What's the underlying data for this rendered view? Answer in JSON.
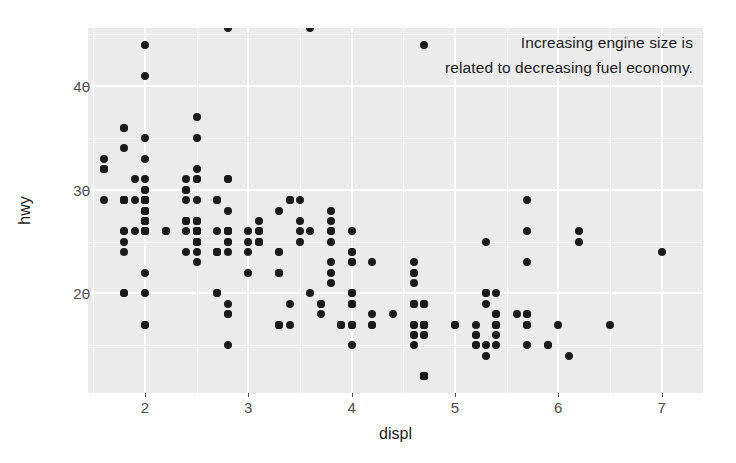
{
  "chart_data": {
    "type": "scatter",
    "title": "",
    "annotation": "Increasing engine size is\nrelated to decreasing fuel economy.",
    "xlabel": "displ",
    "ylabel": "hwy",
    "xlim": [
      1.45,
      7.4
    ],
    "ylim": [
      10.4,
      45.6
    ],
    "xticks": [
      2,
      3,
      4,
      5,
      6,
      7
    ],
    "yticks": [
      20,
      30,
      40
    ],
    "x_minor_ticks": [
      1.5,
      2.5,
      3.5,
      4.5,
      5.5,
      6.5
    ],
    "y_minor_ticks": [
      15,
      25,
      35,
      45
    ],
    "grid": true,
    "legend": "none",
    "panel_background": "#ebebeb",
    "grid_color": "#ffffff",
    "point_color": "#1a1a1a",
    "axis_text_color": "#4d4d4d",
    "n_points": 234,
    "x": [
      1.8,
      1.8,
      2.0,
      2.0,
      2.8,
      2.8,
      3.1,
      1.8,
      1.8,
      2.0,
      2.0,
      2.8,
      2.8,
      3.1,
      3.1,
      2.8,
      3.1,
      4.2,
      5.3,
      5.3,
      5.3,
      5.7,
      6.0,
      5.7,
      5.7,
      6.2,
      6.2,
      7.0,
      5.3,
      5.3,
      5.7,
      6.5,
      2.4,
      2.4,
      3.1,
      3.5,
      3.6,
      2.4,
      3.0,
      3.3,
      3.3,
      3.3,
      3.3,
      3.3,
      3.8,
      3.8,
      3.8,
      4.0,
      3.7,
      3.7,
      3.9,
      3.9,
      4.7,
      4.7,
      4.7,
      5.2,
      5.2,
      3.9,
      4.7,
      4.7,
      4.7,
      5.2,
      5.7,
      5.9,
      4.7,
      4.7,
      4.7,
      4.7,
      4.7,
      4.7,
      5.2,
      5.2,
      5.7,
      5.9,
      4.6,
      5.4,
      5.4,
      4.0,
      4.0,
      4.0,
      4.0,
      4.6,
      5.0,
      4.2,
      4.2,
      4.6,
      4.6,
      4.6,
      5.4,
      5.4,
      3.8,
      3.8,
      4.0,
      4.0,
      4.6,
      4.6,
      4.6,
      4.6,
      5.4,
      1.6,
      1.6,
      1.6,
      1.6,
      1.6,
      1.8,
      1.8,
      1.8,
      2.0,
      2.4,
      2.4,
      2.4,
      2.4,
      2.5,
      2.5,
      3.3,
      2.0,
      2.0,
      2.0,
      2.0,
      2.7,
      2.7,
      2.7,
      3.0,
      3.7,
      4.0,
      4.7,
      4.7,
      4.7,
      5.7,
      6.1,
      4.0,
      4.2,
      4.4,
      4.6,
      5.4,
      5.4,
      5.4,
      4.0,
      4.0,
      4.6,
      5.0,
      2.4,
      2.4,
      2.5,
      2.5,
      3.5,
      3.5,
      3.0,
      3.0,
      3.5,
      3.3,
      3.3,
      4.0,
      5.6,
      3.1,
      3.8,
      3.8,
      3.8,
      5.3,
      2.5,
      2.5,
      2.5,
      2.5,
      2.5,
      2.5,
      2.2,
      2.2,
      2.5,
      2.5,
      2.5,
      2.5,
      2.5,
      2.5,
      2.7,
      2.7,
      3.4,
      3.4,
      2.0,
      2.0,
      2.0,
      2.0,
      2.8,
      1.9,
      2.0,
      2.0,
      2.0,
      2.0,
      2.5,
      2.5,
      2.8,
      2.8,
      1.9,
      2.0,
      2.0,
      2.0,
      2.0,
      2.5,
      2.5,
      2.8,
      2.8,
      1.8,
      1.8,
      2.0,
      2.0,
      2.8,
      2.8,
      3.6,
      1.8,
      1.8,
      1.8,
      1.8,
      1.8,
      4.7,
      5.7,
      2.7,
      2.7,
      2.7,
      3.4,
      3.4,
      4.0,
      4.0,
      2.0,
      2.0,
      2.0,
      2.0,
      2.8,
      1.9,
      2.0,
      2.0,
      2.0,
      2.0,
      2.5,
      2.5,
      2.8,
      2.8,
      3.6
    ],
    "y": [
      29,
      29,
      31,
      30,
      26,
      26,
      27,
      26,
      25,
      28,
      27,
      25,
      25,
      25,
      25,
      24,
      25,
      23,
      20,
      15,
      20,
      17,
      17,
      26,
      23,
      26,
      25,
      24,
      19,
      14,
      15,
      17,
      27,
      30,
      26,
      29,
      26,
      24,
      24,
      22,
      22,
      24,
      24,
      17,
      22,
      21,
      23,
      23,
      19,
      18,
      17,
      17,
      19,
      19,
      12,
      17,
      15,
      17,
      17,
      12,
      17,
      16,
      18,
      15,
      16,
      12,
      17,
      17,
      16,
      12,
      15,
      16,
      17,
      15,
      17,
      17,
      18,
      17,
      19,
      17,
      19,
      19,
      17,
      17,
      17,
      16,
      16,
      17,
      15,
      17,
      26,
      25,
      26,
      24,
      21,
      22,
      23,
      22,
      20,
      33,
      32,
      32,
      29,
      32,
      34,
      36,
      36,
      29,
      26,
      27,
      30,
      31,
      26,
      26,
      28,
      26,
      29,
      28,
      27,
      24,
      24,
      24,
      22,
      19,
      20,
      17,
      12,
      19,
      18,
      14,
      15,
      18,
      18,
      15,
      17,
      16,
      18,
      17,
      19,
      19,
      17,
      29,
      27,
      31,
      32,
      27,
      26,
      26,
      25,
      25,
      17,
      17,
      20,
      18,
      26,
      26,
      27,
      28,
      25,
      25,
      24,
      27,
      25,
      26,
      23,
      26,
      26,
      26,
      26,
      25,
      27,
      25,
      27,
      20,
      20,
      19,
      17,
      20,
      17,
      29,
      27,
      31,
      31,
      26,
      26,
      28,
      27,
      29,
      31,
      31,
      26,
      26,
      27,
      30,
      33,
      35,
      37,
      35,
      15,
      18,
      20,
      20,
      22,
      17,
      19,
      18,
      20,
      29,
      26,
      29,
      29,
      24,
      44,
      29,
      26,
      29,
      29,
      29,
      29,
      23,
      24,
      44,
      41,
      29,
      26,
      28,
      29,
      29,
      29,
      28,
      29,
      26,
      26,
      26
    ]
  },
  "axis": {
    "x_title": "displ",
    "y_title": "hwy",
    "x_tick_labels": [
      "2",
      "3",
      "4",
      "5",
      "6",
      "7"
    ],
    "y_tick_labels": [
      "20",
      "30",
      "40"
    ]
  }
}
